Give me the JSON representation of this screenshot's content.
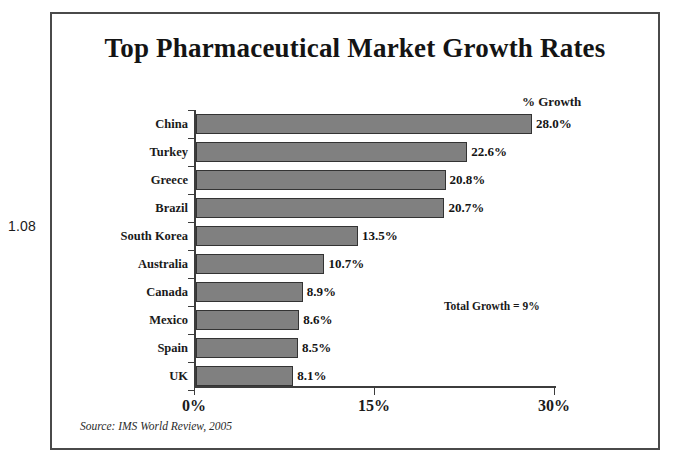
{
  "figure_number": "1.08",
  "chart_data": {
    "type": "bar",
    "orientation": "horizontal",
    "title": "Top Pharmaceutical Market Growth Rates",
    "xlabel": "",
    "ylabel": "",
    "value_axis_header": "% Growth",
    "categories": [
      "China",
      "Turkey",
      "Greece",
      "Brazil",
      "South Korea",
      "Australia",
      "Canada",
      "Mexico",
      "Spain",
      "UK"
    ],
    "values": [
      28.0,
      22.6,
      20.8,
      20.7,
      13.5,
      10.7,
      8.9,
      8.6,
      8.5,
      8.1
    ],
    "value_labels": [
      "28.0%",
      "22.6%",
      "20.8%",
      "20.7%",
      "13.5%",
      "10.7%",
      "8.9%",
      "8.6%",
      "8.5%",
      "8.1%"
    ],
    "xlim": [
      0,
      30
    ],
    "xticks": [
      0,
      15,
      30
    ],
    "xtick_labels": [
      "0%",
      "15%",
      "30%"
    ],
    "grid": false,
    "legend": false,
    "bar_color": "#808080",
    "bar_border_color": "#333333",
    "annotation": "Total Growth = 9%",
    "source": "Source: IMS World Review, 2005"
  }
}
